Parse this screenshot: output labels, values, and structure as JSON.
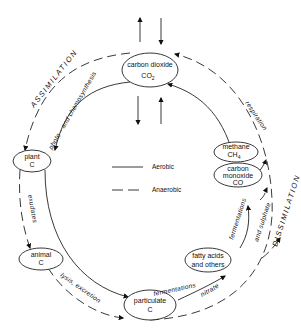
{
  "diagram": {
    "type": "carbon cycle",
    "nodes": [
      {
        "id": "co2",
        "line1": "carbon dioxide",
        "line2": "CO",
        "sub": "2"
      },
      {
        "id": "plant",
        "line1": "plant",
        "line2": "C"
      },
      {
        "id": "animal",
        "line1": "animal",
        "line2": "C"
      },
      {
        "id": "particulate",
        "line1": "particulate",
        "line2": "C"
      },
      {
        "id": "fatty",
        "line1": "fatty acids",
        "line2": "and others"
      },
      {
        "id": "methane",
        "line1": "methane",
        "line2": "CH",
        "sub": "4"
      },
      {
        "id": "co",
        "line1": "carbon",
        "line2": "monoxide",
        "line3": "CO"
      }
    ],
    "processes": {
      "assimilation": "ASSIMILATION",
      "dissimilation": "DISSIMILATION",
      "photosynthesis": "photo - and  chemosynthesis",
      "respiration": "respiration",
      "exudates": "exudates",
      "lysis": "lysis, excretion",
      "fermentations_lower": "fermentations",
      "fermentations_upper": "fermentations",
      "nitrate": "nitrate",
      "sulphate": "and  sulphate"
    },
    "legend": {
      "aerobic": "Aerobic",
      "anaerobic": "Anaerobic"
    }
  }
}
